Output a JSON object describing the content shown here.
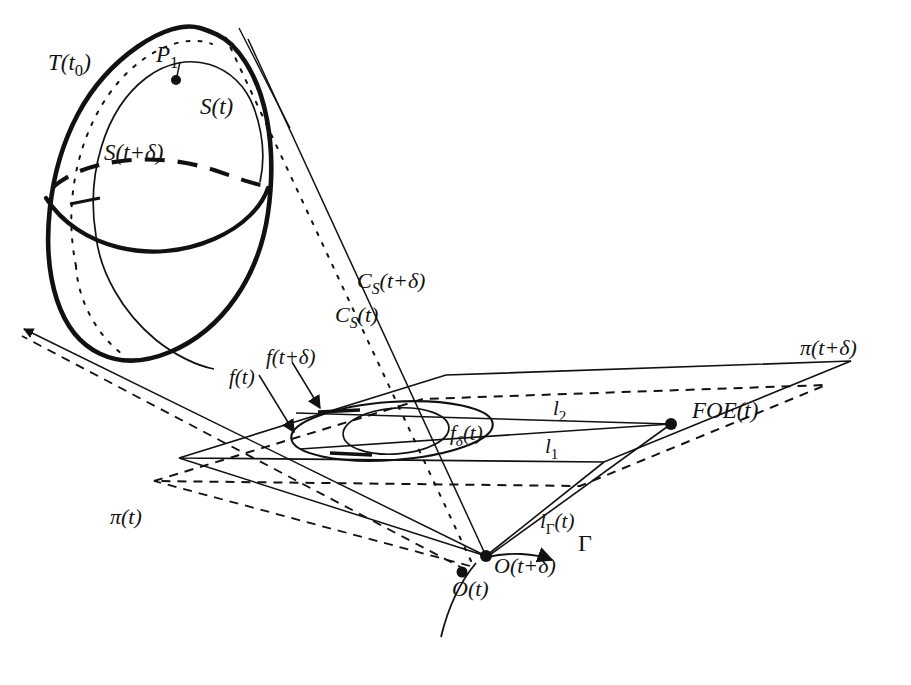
{
  "figure": {
    "background_color": "#ffffff",
    "ink_color": "#111111",
    "width": 911,
    "height": 685
  },
  "labels": {
    "surface_tangent": "T(t",
    "surface_tangent_sub": "0",
    "surface_tangent_close": ")",
    "point_p": "P",
    "point_p_sub": "1",
    "surface_t": "S(t)",
    "surface_t_delta": "S(t+δ)",
    "cone_t_delta_main": "C",
    "cone_t_delta_sub": "S",
    "cone_t_delta_arg": "(t+δ)",
    "cone_t_main": "C",
    "cone_t_sub": "S",
    "cone_t_arg": "(t)",
    "flow_t": "f(t)",
    "flow_t_delta": "f(t+δ)",
    "flow_delta_main": "f",
    "flow_delta_sub": "δ",
    "flow_delta_arg": "(t)",
    "plane_t": "π(t)",
    "plane_t_delta": "π(t+δ)",
    "line_l1_main": "l",
    "line_l1_sub": "1",
    "line_l2_main": "l",
    "line_l2_sub": "2",
    "line_l_gamma_main": "l",
    "line_l_gamma_sub": "Γ",
    "line_l_gamma_arg": "(t)",
    "foe": "FOE(t)",
    "origin_t": "O(t)",
    "origin_t_delta": "O(t+δ)",
    "gamma": "Γ"
  },
  "icons": {
    "arrowhead_flow_t": "triangle-arrowhead-icon",
    "arrowhead_flow_t_delta": "triangle-arrowhead-icon",
    "arrowhead_gamma": "triangle-arrowhead-icon",
    "point_marker_p": "filled-dot-icon",
    "point_marker_foe": "filled-dot-icon",
    "point_marker_origin_t": "filled-dot-icon",
    "point_marker_origin_t_delta": "filled-dot-icon"
  },
  "geometry": {
    "ellipsoid_outline": "M 232,45 C 268,82 277,150 268,213 C 259,276 223,330 170,352 C 117,374 74,352 57,300 C 40,248 48,170 78,114 C 108,58 168,18 200,28 C 212,32 223,36 232,45 Z",
    "ellipsoid_equator_front": "M 48,196 C 78,244 150,262 212,237 C 243,225 262,205 268,186",
    "ellipsoid_equator_back": "M 48,196 C 76,168 150,156 212,176 C 243,186 262,194 268,186",
    "surface_inner_curve": "M 95,230 C 88,170 106,108 146,78 C 186,48 234,62 252,104 C 262,128 264,152 260,176",
    "surface_inner_back": "M 95,230 C 100,250 118,272 140,284",
    "surface_dotted_curve": "M 77,260 C 62,196 78,122 120,76 C 150,43 188,32 214,44",
    "plane_solid": "M 179,458 L 446,375 L 851,361 L 604,462 Z",
    "plane_dashed": "M 154,481 L 423,399 L 826,385 L 580,486 Z",
    "outer_ellipse_cx": 392,
    "outer_ellipse_cy": 431,
    "outer_ellipse_rx": 101,
    "outer_ellipse_ry": 29,
    "outer_ellipse_rot": -4,
    "inner_ellipse_cx": 396,
    "inner_ellipse_cy": 431,
    "inner_ellipse_rx": 53,
    "inner_ellipse_ry": 23,
    "inner_ellipse_rot": -4,
    "origin_t_delta_x": 486,
    "origin_t_delta_y": 556,
    "origin_t_x": 462,
    "origin_t_y": 571,
    "foe_x": 671,
    "foe_y": 424,
    "point_p_x": 176,
    "point_p_y": 80,
    "gamma_curve": "M 723,690 C 700,660 640,625 575,600",
    "cone_solid_left": "M 486,556 L 234,44",
    "cone_solid_right": "M 486,556 L 302,400",
    "cone_dotted_left": "M 486,556 L 214,42",
    "tangent_line": "M 238,28 L 282,112"
  }
}
